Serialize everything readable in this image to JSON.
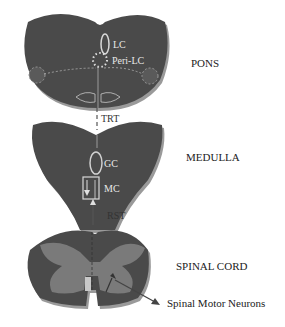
{
  "diagram": {
    "regions": [
      {
        "id": "pons",
        "label": "PONS"
      },
      {
        "id": "medulla",
        "label": "MEDULLA"
      },
      {
        "id": "spinal_cord",
        "label": "SPINAL CORD"
      }
    ],
    "nuclei": {
      "lc": "LC",
      "peri_lc": "Peri-LC",
      "gc": "GC",
      "mc": "MC"
    },
    "tracts": {
      "trt": "TRT",
      "rst": "RST"
    },
    "target": "Spinal Motor Neurons",
    "colors": {
      "tissue": "#4a4a4a",
      "tissue_shadow": "#8a8a8a",
      "grey_matter": "#7a7a7a",
      "outline": "#d8d8d8",
      "arrow": "#444444"
    }
  }
}
